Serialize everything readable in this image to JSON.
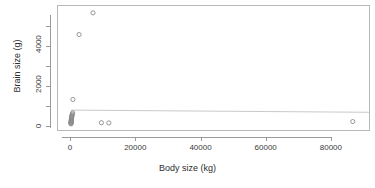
{
  "chart_data": {
    "type": "scatter",
    "title": "",
    "subtitle": "",
    "xlabel": "Body size (kg)",
    "ylabel": "Brain size (g)",
    "xlim": [
      -4000,
      92000
    ],
    "ylim": [
      -250,
      6050
    ],
    "grid": false,
    "legend": null,
    "x_ticks": [
      0,
      20000,
      40000,
      60000,
      80000
    ],
    "x_tick_labels": [
      "0",
      "20000",
      "40000",
      "60000",
      "80000"
    ],
    "y_ticks": [
      0,
      2000,
      4000
    ],
    "y_tick_labels": [
      "0",
      "2000",
      "4000"
    ],
    "y_minor_ticks": [
      1000,
      3000,
      5000
    ],
    "marker": "open-circle",
    "marker_color": "#8a8a8a",
    "series": [
      {
        "name": "observations",
        "x": [
          3,
          10,
          25,
          40,
          55,
          70,
          85,
          110,
          135,
          160,
          190,
          230,
          280,
          340,
          420,
          520,
          600,
          2500,
          6800,
          9400,
          11700,
          87000
        ],
        "y": [
          60,
          90,
          120,
          150,
          180,
          200,
          230,
          260,
          300,
          340,
          380,
          420,
          460,
          500,
          560,
          620,
          1300,
          4600,
          5700,
          120,
          110,
          180
        ]
      }
    ],
    "fit_line": {
      "type": "linear",
      "intercept": 760,
      "slope": -0.0012,
      "color": "#c2c2c2",
      "x_start": 0,
      "x_end": 92000
    }
  }
}
